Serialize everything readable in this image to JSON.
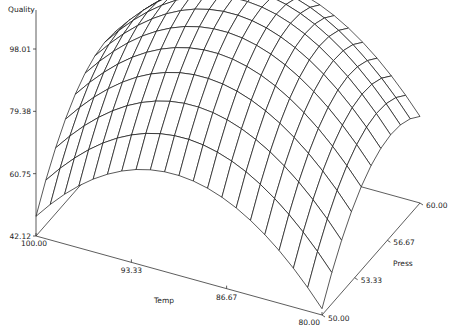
{
  "chart_data": {
    "type": "surface",
    "title": "",
    "xlabel": "Temp",
    "ylabel": "Press",
    "zlabel": "Quality",
    "xlim": [
      80.0,
      100.0
    ],
    "ylim": [
      50.0,
      60.0
    ],
    "zlim": [
      42.12,
      98.01
    ],
    "x_ticks": [
      "100.00",
      "93.33",
      "86.67",
      "80.00"
    ],
    "y_ticks": [
      "50.00",
      "53.33",
      "56.67",
      "60.00"
    ],
    "z_ticks": [
      "42.12",
      "60.75",
      "79.38",
      "98.01"
    ],
    "grid_resolution": {
      "temp_lines": 21,
      "press_lines": 11
    },
    "model": {
      "description": "Quadratic response surface: Quality = q0 + bT*(t) + bTT*t^2 + bP*(p) + bPP*p^2 + bTP*t*p, with t,p coded to [-1,1]",
      "q0": 98.0,
      "bT": 2.0,
      "bTT": -26.0,
      "bP": 12.0,
      "bPP": -14.0,
      "bTP": 0.0
    },
    "corner_values": [
      {
        "temp": 100.0,
        "press": 50.0,
        "quality": 44.0
      },
      {
        "temp": 100.0,
        "press": 60.0,
        "quality": 70.0
      },
      {
        "temp": 80.0,
        "press": 50.0,
        "quality": 44.0
      },
      {
        "temp": 80.0,
        "press": 60.0,
        "quality": 72.0
      }
    ],
    "peak": {
      "temp": 90.0,
      "press": 57.0,
      "quality": 99.5
    },
    "grid": "off",
    "legend": "none"
  }
}
